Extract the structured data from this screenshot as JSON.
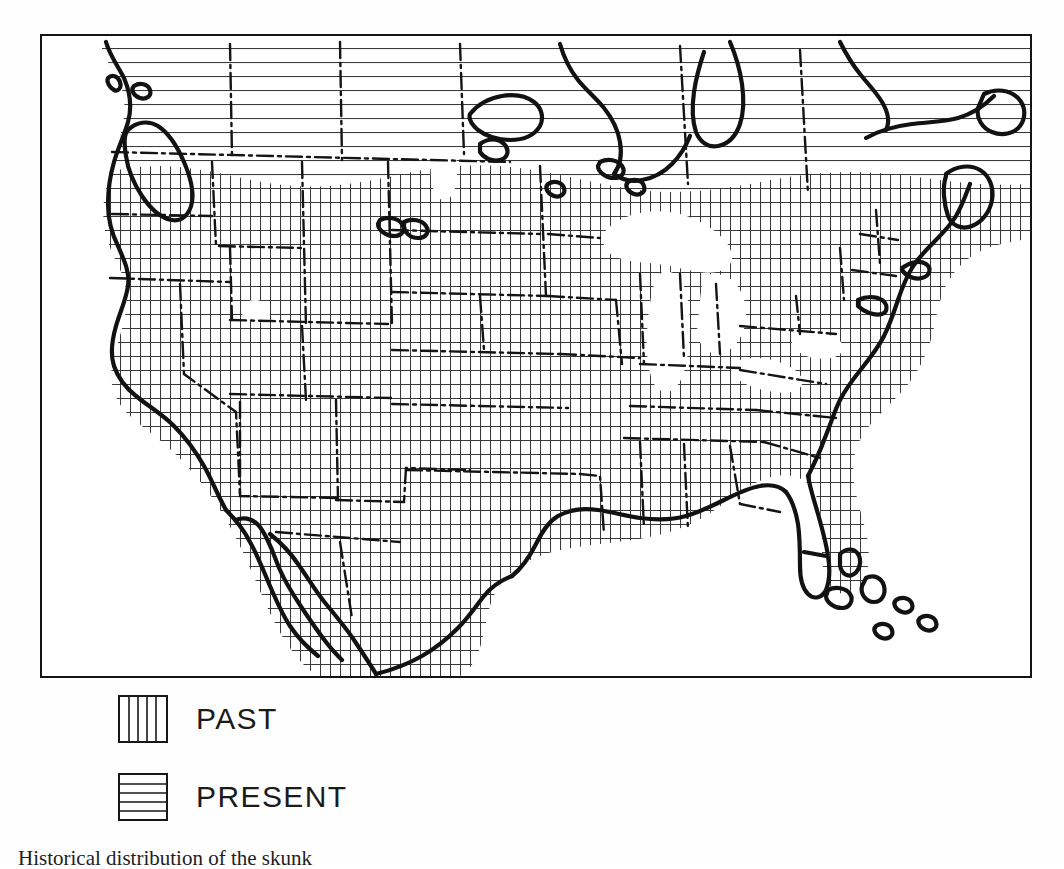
{
  "figure": {
    "title": "Historical distribution of the skunk",
    "caption_number": "",
    "caption_text": "Historical distribution of the skunk"
  },
  "map": {
    "name": "north-america-distribution-map",
    "region": "North America",
    "frame_color": "#141414",
    "background_color": "#ffffff",
    "hatch_color": "#3a3a3a",
    "coastline_color": "#121212",
    "border_style": "dash-dot",
    "features": [
      "Pacific coastline",
      "Vancouver Island",
      "Great Lakes",
      "Hudson Bay",
      "Gulf of Mexico",
      "Baja California",
      "Florida peninsula",
      "Bahamas islands",
      "Atlantic coastline",
      "state and provincial boundaries"
    ]
  },
  "legend": {
    "name": "distribution-legend",
    "items": [
      {
        "label": "PAST",
        "pattern": "vertical-hatch"
      },
      {
        "label": "PRESENT",
        "pattern": "horizontal-hatch"
      }
    ]
  },
  "colors": {
    "ink": "#141414",
    "paper": "#ffffff",
    "hatch": "#3a3a3a"
  }
}
